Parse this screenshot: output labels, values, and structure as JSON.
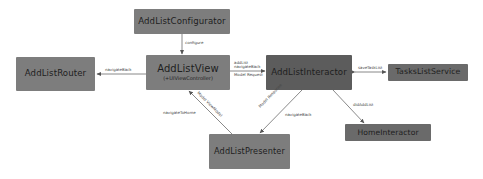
{
  "diagram": {
    "nodes": [
      {
        "id": "configurator",
        "title": "AddListConfigurator",
        "color": "#7d7d7d"
      },
      {
        "id": "router",
        "title": "AddListRouter",
        "color": "#7d7d7d"
      },
      {
        "id": "view",
        "title": "AddListView",
        "subtitle": "(+UIViewController)",
        "color": "#7d7d7d"
      },
      {
        "id": "interactor",
        "title": "AddListInteractor",
        "color": "#5c5c5c"
      },
      {
        "id": "service",
        "title": "TasksListService",
        "color": "#6a6a6a"
      },
      {
        "id": "home",
        "title": "HomeInteractor",
        "color": "#6a6a6a"
      },
      {
        "id": "presenter",
        "title": "AddListPresenter",
        "color": "#7d7d7d"
      }
    ],
    "edges": [
      {
        "from": "configurator",
        "to": "view",
        "label": "configure"
      },
      {
        "from": "view",
        "to": "router",
        "label": "navigateBack"
      },
      {
        "from": "view",
        "to": "interactor",
        "label_top": "addList",
        "label_top2": "navigateBack",
        "label_bottom": "Model Request"
      },
      {
        "from": "service",
        "to": "interactor",
        "label": "saveTaskList",
        "bidirectional": true
      },
      {
        "from": "interactor",
        "to": "home",
        "label": "didAddList"
      },
      {
        "from": "interactor",
        "to": "presenter",
        "label_rotated": "Model Response",
        "label": "navigateBack"
      },
      {
        "from": "presenter",
        "to": "view",
        "label_rotated": "Model ViewModel",
        "label": "navigateToHome"
      }
    ],
    "line_color": "#6b6b6b"
  }
}
